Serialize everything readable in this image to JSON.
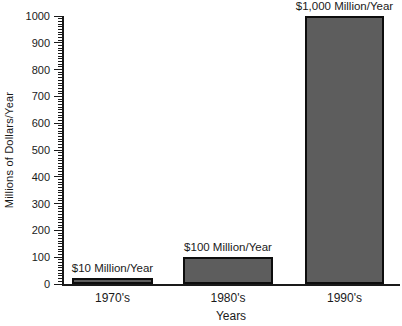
{
  "chart_data": {
    "type": "bar",
    "title": "",
    "xlabel": "Years",
    "ylabel": "Millions of Dollars/Year",
    "categories": [
      "1970's",
      "1980's",
      "1990's"
    ],
    "values": [
      10,
      100,
      1000
    ],
    "bar_labels": [
      "$10 Million/Year",
      "$100 Million/Year",
      "$1,000 Million/Year"
    ],
    "ylim": [
      0,
      1000
    ],
    "ytick_interval": 100,
    "yminor_tick_interval": 10,
    "ytick_labels": [
      "0",
      "100",
      "200",
      "300",
      "400",
      "500",
      "600",
      "700",
      "800",
      "900",
      "1000"
    ],
    "grid": false,
    "legend": "none",
    "colors": {
      "bar_fill": "#5d5d5d",
      "bar_border": "#0d0d0d",
      "axis": "#1a1a1a",
      "text": "#1a1a1a",
      "background": "#ffffff"
    }
  }
}
